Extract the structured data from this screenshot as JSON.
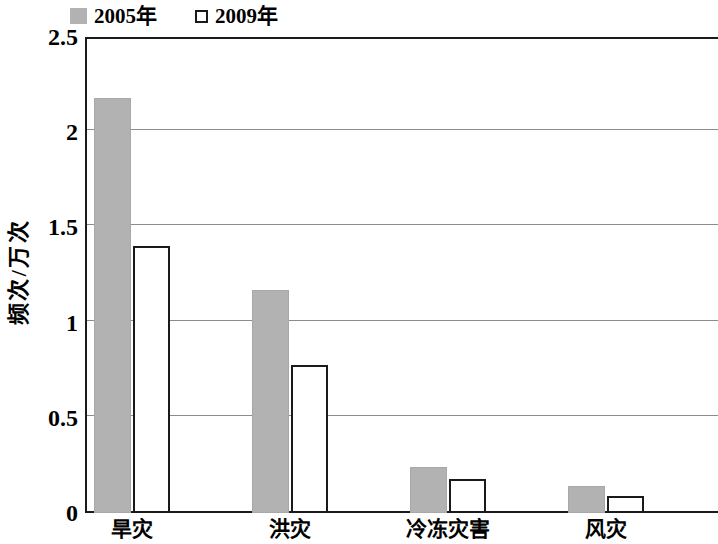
{
  "chart_data": {
    "type": "bar",
    "title": "",
    "subtitle": "",
    "xlabel": "",
    "ylabel": "频次/万次",
    "categories": [
      "旱灾",
      "洪灾",
      "冷冻灾害",
      "风灾"
    ],
    "series": [
      {
        "name": "2005年",
        "values": [
          2.18,
          1.17,
          0.24,
          0.14
        ],
        "color": "#b2b2b2",
        "style": "filled"
      },
      {
        "name": "2009年",
        "values": [
          1.4,
          0.78,
          0.18,
          0.09
        ],
        "color": "#ffffff",
        "style": "outlined"
      }
    ],
    "ylim": [
      0,
      2.5
    ],
    "yticks": [
      0,
      0.5,
      1,
      1.5,
      2,
      2.5
    ],
    "ytick_labels": [
      "0",
      "0.5",
      "1",
      "1.5",
      "2",
      "2.5"
    ],
    "grid": true,
    "grid_axis": "y",
    "legend_position": "top-left",
    "legend_entries": [
      "2005年",
      "2009年"
    ]
  },
  "colors": {
    "axis": "#1a1a1a",
    "grid": "#8c8c8c",
    "bar_2005": "#b2b2b2",
    "bar_2009_fill": "#ffffff",
    "bar_2009_stroke": "#1a1a1a",
    "background": "#ffffff"
  }
}
